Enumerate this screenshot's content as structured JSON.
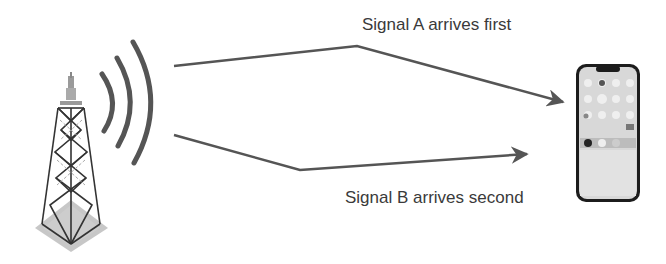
{
  "diagram": {
    "type": "signal-multipath",
    "colors": {
      "line": "#555555",
      "text": "#3a3a3a",
      "tower": "#333333",
      "base": "#b5b5b5"
    },
    "nodes": [
      {
        "id": "tower",
        "icon": "cell-tower-icon"
      },
      {
        "id": "waves",
        "icon": "radio-waves-icon"
      },
      {
        "id": "phone",
        "icon": "smartphone-icon"
      }
    ],
    "edges": [
      {
        "from": "tower",
        "to": "phone",
        "label": "Signal A arrives first"
      },
      {
        "from": "tower",
        "to": "phone",
        "label": "Signal B arrives second"
      }
    ]
  },
  "labels": {
    "signal_a": "Signal A arrives first",
    "signal_b": "Signal B arrives second"
  }
}
